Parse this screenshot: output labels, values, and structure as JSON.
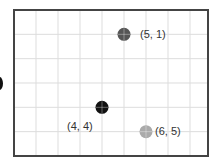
{
  "grid": {
    "columns": 9,
    "rows": 6,
    "origin": "top-left",
    "frame": {
      "left": 14,
      "top": 10,
      "right": 208,
      "bottom": 156
    },
    "col_spacing": 22,
    "row_spacing": 24.33,
    "line_color": "#dddddd",
    "border_color": "#444444"
  },
  "points": [
    {
      "id": "p-5-1",
      "col": 5,
      "row": 1,
      "label": "(5, 1)",
      "color": "#555555",
      "label_dx": 16,
      "label_dy": -6
    },
    {
      "id": "p-4-4",
      "col": 4,
      "row": 4,
      "label": "(4, 4)",
      "color": "#111111",
      "label_dx": -35,
      "label_dy": 13
    },
    {
      "id": "p-6-5",
      "col": 6,
      "row": 5,
      "label": "(6, 5)",
      "color": "#aaaaaa",
      "label_dx": 9,
      "label_dy": -7
    }
  ],
  "labels": {
    "p0": "(5, 1)",
    "p1": "(4, 4)",
    "p2": "(6, 5)"
  }
}
